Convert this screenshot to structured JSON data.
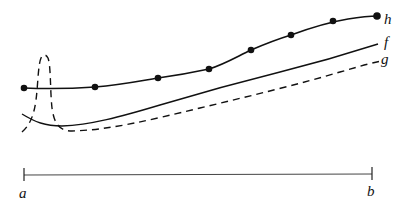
{
  "diagram": {
    "curves": [
      {
        "id": "h",
        "label": "h",
        "style": "solid",
        "markers": "dots"
      },
      {
        "id": "f",
        "label": "f",
        "style": "solid"
      },
      {
        "id": "g",
        "label": "g",
        "style": "dashed"
      }
    ],
    "interval": {
      "start_label": "a",
      "end_label": "b"
    },
    "colors": {
      "stroke": "#111111",
      "background": "#ffffff"
    }
  }
}
